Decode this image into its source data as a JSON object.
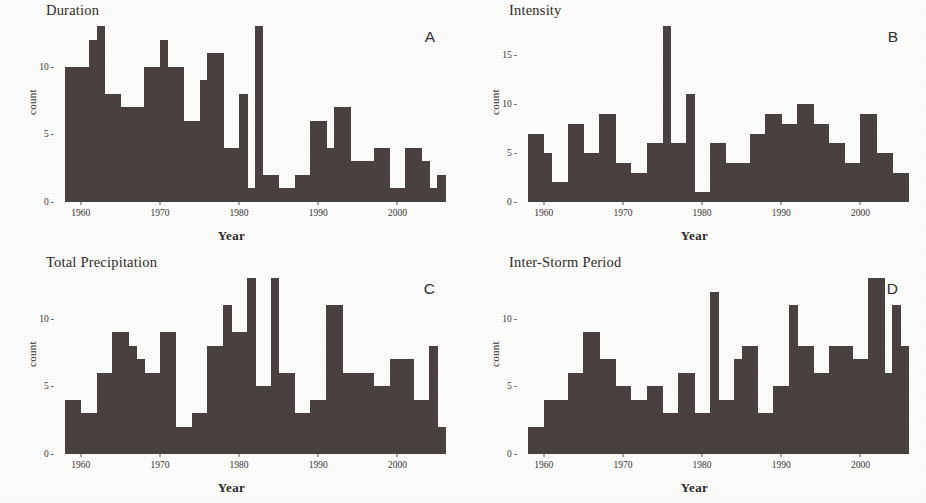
{
  "figure": {
    "xlabel": "Year",
    "ylabel": "count",
    "bar_color": "#4a4241",
    "background_color": "#fdfdfc"
  },
  "panels": {
    "a": {
      "title": "Duration",
      "letter": "A"
    },
    "b": {
      "title": "Intensity",
      "letter": "B"
    },
    "c": {
      "title": "Total Precipitation",
      "letter": "C"
    },
    "d": {
      "title": "Inter-Storm Period",
      "letter": "D"
    }
  },
  "chart_data": [
    {
      "type": "bar",
      "title": "Duration",
      "panel_letter": "A",
      "xlabel": "Year",
      "ylabel": "count",
      "xlim": [
        1957,
        2006
      ],
      "ylim": [
        0,
        13
      ],
      "grid": false,
      "legend": null,
      "xticks": [
        1960,
        1970,
        1980,
        1990,
        2000
      ],
      "yticks": [
        0,
        5,
        10
      ],
      "ytick_labels": [
        "0",
        "5",
        "10"
      ],
      "x": [
        1958,
        1959,
        1960,
        1961,
        1962,
        1963,
        1964,
        1965,
        1966,
        1967,
        1968,
        1969,
        1970,
        1971,
        1972,
        1973,
        1974,
        1975,
        1976,
        1977,
        1978,
        1979,
        1980,
        1981,
        1982,
        1983,
        1984,
        1985,
        1986,
        1987,
        1988,
        1989,
        1990,
        1991,
        1992,
        1993,
        1994,
        1995,
        1996,
        1997,
        1998,
        1999,
        2000,
        2001,
        2002,
        2003,
        2004,
        2005
      ],
      "values": [
        10,
        10,
        10,
        12,
        13,
        8,
        8,
        7,
        7,
        7,
        10,
        10,
        12,
        10,
        10,
        6,
        6,
        9,
        11,
        11,
        4,
        4,
        8,
        1,
        13,
        2,
        2,
        1,
        1,
        2,
        2,
        6,
        6,
        4,
        7,
        7,
        3,
        3,
        3,
        4,
        4,
        1,
        1,
        4,
        4,
        3,
        1,
        2
      ]
    },
    {
      "type": "bar",
      "title": "Intensity",
      "panel_letter": "B",
      "xlabel": "Year",
      "ylabel": "count",
      "xlim": [
        1957,
        2006
      ],
      "ylim": [
        0,
        18
      ],
      "grid": false,
      "legend": null,
      "xticks": [
        1960,
        1970,
        1980,
        1990,
        2000
      ],
      "yticks": [
        0,
        5,
        10,
        15
      ],
      "ytick_labels": [
        "0",
        "5",
        "10",
        "15"
      ],
      "x": [
        1958,
        1959,
        1960,
        1961,
        1962,
        1963,
        1964,
        1965,
        1966,
        1967,
        1968,
        1969,
        1970,
        1971,
        1972,
        1973,
        1974,
        1975,
        1976,
        1977,
        1978,
        1979,
        1980,
        1981,
        1982,
        1983,
        1984,
        1985,
        1986,
        1987,
        1988,
        1989,
        1990,
        1991,
        1992,
        1993,
        1994,
        1995,
        1996,
        1997,
        1998,
        1999,
        2000,
        2001,
        2002,
        2003,
        2004,
        2005
      ],
      "values": [
        7,
        7,
        5,
        2,
        2,
        8,
        8,
        5,
        5,
        9,
        9,
        4,
        4,
        3,
        3,
        6,
        6,
        18,
        6,
        6,
        11,
        1,
        1,
        6,
        6,
        4,
        4,
        4,
        7,
        7,
        9,
        9,
        8,
        8,
        10,
        10,
        8,
        8,
        6,
        6,
        4,
        4,
        9,
        9,
        5,
        5,
        3,
        3
      ]
    },
    {
      "type": "bar",
      "title": "Total Precipitation",
      "panel_letter": "C",
      "xlabel": "Year",
      "ylabel": "count",
      "xlim": [
        1957,
        2006
      ],
      "ylim": [
        0,
        13
      ],
      "grid": false,
      "legend": null,
      "xticks": [
        1960,
        1970,
        1980,
        1990,
        2000
      ],
      "yticks": [
        0,
        5,
        10
      ],
      "ytick_labels": [
        "0",
        "5",
        "10"
      ],
      "x": [
        1958,
        1959,
        1960,
        1961,
        1962,
        1963,
        1964,
        1965,
        1966,
        1967,
        1968,
        1969,
        1970,
        1971,
        1972,
        1973,
        1974,
        1975,
        1976,
        1977,
        1978,
        1979,
        1980,
        1981,
        1982,
        1983,
        1984,
        1985,
        1986,
        1987,
        1988,
        1989,
        1990,
        1991,
        1992,
        1993,
        1994,
        1995,
        1996,
        1997,
        1998,
        1999,
        2000,
        2001,
        2002,
        2003,
        2004,
        2005
      ],
      "values": [
        4,
        4,
        3,
        3,
        6,
        6,
        9,
        9,
        8,
        7,
        6,
        6,
        9,
        9,
        2,
        2,
        3,
        3,
        8,
        8,
        11,
        9,
        9,
        13,
        5,
        5,
        13,
        6,
        6,
        3,
        3,
        4,
        4,
        11,
        11,
        6,
        6,
        6,
        6,
        5,
        5,
        7,
        7,
        7,
        4,
        4,
        8,
        2
      ]
    },
    {
      "type": "bar",
      "title": "Inter-Storm Period",
      "panel_letter": "D",
      "xlabel": "Year",
      "ylabel": "count",
      "xlim": [
        1957,
        2006
      ],
      "ylim": [
        0,
        13
      ],
      "grid": false,
      "legend": null,
      "xticks": [
        1960,
        1970,
        1980,
        1990,
        2000
      ],
      "yticks": [
        0,
        5,
        10
      ],
      "ytick_labels": [
        "0",
        "5",
        "10"
      ],
      "x": [
        1958,
        1959,
        1960,
        1961,
        1962,
        1963,
        1964,
        1965,
        1966,
        1967,
        1968,
        1969,
        1970,
        1971,
        1972,
        1973,
        1974,
        1975,
        1976,
        1977,
        1978,
        1979,
        1980,
        1981,
        1982,
        1983,
        1984,
        1985,
        1986,
        1987,
        1988,
        1989,
        1990,
        1991,
        1992,
        1993,
        1994,
        1995,
        1996,
        1997,
        1998,
        1999,
        2000,
        2001,
        2002,
        2003,
        2004,
        2005
      ],
      "values": [
        2,
        2,
        4,
        4,
        4,
        6,
        6,
        9,
        9,
        7,
        7,
        5,
        5,
        4,
        4,
        5,
        5,
        3,
        3,
        6,
        6,
        3,
        3,
        12,
        4,
        4,
        7,
        8,
        8,
        3,
        3,
        5,
        5,
        11,
        8,
        8,
        6,
        6,
        8,
        8,
        8,
        7,
        7,
        13,
        13,
        6,
        11,
        8
      ]
    }
  ]
}
